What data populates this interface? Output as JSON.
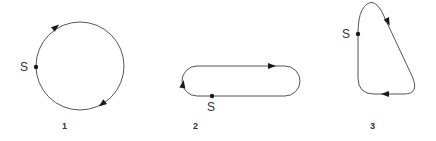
{
  "figures": [
    {
      "id": "1",
      "label": "1",
      "shape": "circle",
      "direction": "clockwise",
      "start_label": "S"
    },
    {
      "id": "2",
      "label": "2",
      "shape": "stadium",
      "direction": "clockwise",
      "start_label": "S"
    },
    {
      "id": "3",
      "label": "3",
      "shape": "teardrop",
      "direction": "clockwise",
      "start_label": "S"
    }
  ],
  "colors": {
    "stroke": "#555555",
    "marker": "#1a1a1a",
    "text": "#333333"
  }
}
